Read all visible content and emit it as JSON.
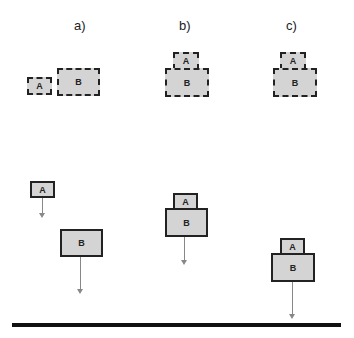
{
  "panels": [
    {
      "label": "a)",
      "top": {
        "a": "A",
        "b": "B"
      },
      "bottom": {
        "a": "A",
        "b": "B"
      }
    },
    {
      "label": "b)",
      "top": {
        "a": "A",
        "b": "B"
      },
      "bottom": {
        "a": "A",
        "b": "B"
      }
    },
    {
      "label": "c)",
      "top": {
        "a": "A",
        "b": "B"
      },
      "bottom": {
        "a": "A",
        "b": "B"
      }
    }
  ]
}
